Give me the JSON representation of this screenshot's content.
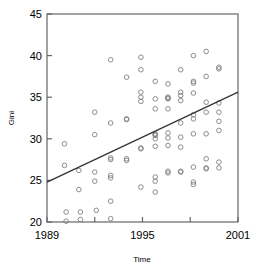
{
  "chart_data": {
    "type": "scatter",
    "title": "",
    "xlabel": "Time",
    "ylabel": "Gini",
    "xlim": [
      1989,
      2001
    ],
    "ylim": [
      20,
      45
    ],
    "xticks": [
      1989,
      1995,
      2001
    ],
    "xtick_labels": [
      "1989",
      "1995",
      "2001"
    ],
    "xminor_ticks": [
      1992,
      1998
    ],
    "yticks": [
      20,
      25,
      30,
      35,
      40,
      45
    ],
    "ytick_labels": [
      "20",
      "25",
      "30",
      "35",
      "40",
      "45"
    ],
    "grid": false,
    "legend": null,
    "marker": "open-circle",
    "marker_color": "#808080",
    "line_color": "#333333",
    "frame_color": "#666666",
    "series": [
      {
        "name": "Gini observations",
        "points": [
          [
            1990.1,
            29.4
          ],
          [
            1990.1,
            26.8
          ],
          [
            1990.2,
            21.2
          ],
          [
            1990.2,
            20.1
          ],
          [
            1991.0,
            26.2
          ],
          [
            1991.0,
            23.9
          ],
          [
            1991.1,
            21.2
          ],
          [
            1991.1,
            20.3
          ],
          [
            1992.0,
            33.2
          ],
          [
            1992.0,
            30.5
          ],
          [
            1992.0,
            26.0
          ],
          [
            1992.0,
            24.9
          ],
          [
            1992.1,
            21.4
          ],
          [
            1993.0,
            39.5
          ],
          [
            1993.0,
            31.9
          ],
          [
            1993.0,
            27.7
          ],
          [
            1993.0,
            27.5
          ],
          [
            1993.0,
            25.6
          ],
          [
            1993.0,
            25.3
          ],
          [
            1993.0,
            22.5
          ],
          [
            1993.0,
            20.4
          ],
          [
            1994.0,
            37.4
          ],
          [
            1994.0,
            32.4
          ],
          [
            1994.0,
            32.3
          ],
          [
            1994.0,
            27.6
          ],
          [
            1994.0,
            27.4
          ],
          [
            1994.9,
            39.8
          ],
          [
            1994.9,
            38.3
          ],
          [
            1994.9,
            35.6
          ],
          [
            1994.9,
            35.0
          ],
          [
            1994.9,
            34.5
          ],
          [
            1994.9,
            28.9
          ],
          [
            1994.9,
            28.8
          ],
          [
            1994.9,
            24.2
          ],
          [
            1995.8,
            36.9
          ],
          [
            1995.8,
            34.8
          ],
          [
            1995.8,
            33.6
          ],
          [
            1995.8,
            30.6
          ],
          [
            1995.8,
            30.5
          ],
          [
            1995.8,
            30.4
          ],
          [
            1995.8,
            30.0
          ],
          [
            1995.8,
            29.1
          ],
          [
            1995.8,
            25.4
          ],
          [
            1995.8,
            24.9
          ],
          [
            1995.8,
            23.6
          ],
          [
            1996.6,
            36.6
          ],
          [
            1996.6,
            35.0
          ],
          [
            1996.6,
            34.9
          ],
          [
            1996.6,
            34.8
          ],
          [
            1996.6,
            33.6
          ],
          [
            1996.6,
            30.7
          ],
          [
            1996.6,
            30.1
          ],
          [
            1996.6,
            29.2
          ],
          [
            1996.6,
            26.1
          ],
          [
            1996.6,
            25.9
          ],
          [
            1997.4,
            38.3
          ],
          [
            1997.4,
            35.6
          ],
          [
            1997.4,
            35.2
          ],
          [
            1997.4,
            34.6
          ],
          [
            1997.4,
            31.9
          ],
          [
            1997.4,
            30.2
          ],
          [
            1997.4,
            29.0
          ],
          [
            1997.4,
            26.1
          ],
          [
            1997.4,
            26.0
          ],
          [
            1998.2,
            40.0
          ],
          [
            1998.2,
            36.9
          ],
          [
            1998.2,
            36.7
          ],
          [
            1998.2,
            35.5
          ],
          [
            1998.2,
            32.9
          ],
          [
            1998.2,
            32.4
          ],
          [
            1998.2,
            30.6
          ],
          [
            1998.2,
            26.6
          ],
          [
            1998.2,
            24.8
          ],
          [
            1998.2,
            24.5
          ],
          [
            1999.0,
            40.5
          ],
          [
            1999.0,
            37.5
          ],
          [
            1999.0,
            34.4
          ],
          [
            1999.0,
            33.2
          ],
          [
            1999.0,
            30.6
          ],
          [
            1999.0,
            27.6
          ],
          [
            1999.0,
            26.5
          ],
          [
            1999.0,
            26.4
          ],
          [
            1999.8,
            38.6
          ],
          [
            1999.8,
            38.4
          ],
          [
            1999.8,
            34.3
          ],
          [
            1999.8,
            33.2
          ],
          [
            1999.8,
            32.1
          ],
          [
            1999.8,
            31.0
          ],
          [
            1999.8,
            27.2
          ],
          [
            1999.8,
            26.5
          ]
        ]
      }
    ],
    "trendline": {
      "name": "fitted regression line",
      "x_start": 1989,
      "y_start": 24.8,
      "x_end": 2001,
      "y_end": 35.6
    }
  }
}
